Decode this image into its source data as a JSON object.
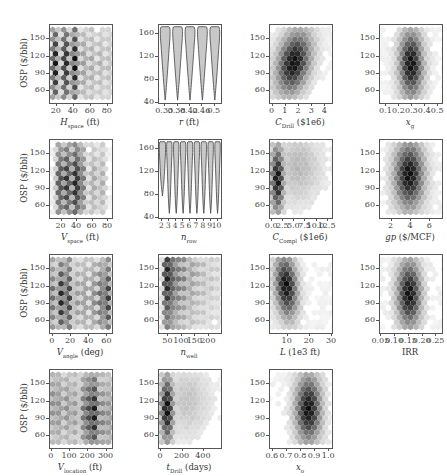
{
  "figure": {
    "ylabel": "OSP ($/bbl)",
    "layout": {
      "rows": 4,
      "cols": 4
    }
  },
  "chart_data": [
    {
      "id": "hspace",
      "type": "heatmap",
      "subtype": "hexbin",
      "row": 0,
      "col": 0,
      "xlabel": "H",
      "xlabel_sub": "space",
      "xlabel_unit": " (ft)",
      "xticks": [
        "20",
        "40",
        "60",
        "80"
      ],
      "xlim": [
        12,
        85
      ],
      "yticks": [
        "60",
        "90",
        "120",
        "150"
      ],
      "ylim": [
        40,
        175
      ],
      "ylabel": "OSP ($/bbl)",
      "density": "discrete vertical bands at ~20,30,40,50,60,70,80; darkest at 20-40, centered ~110"
    },
    {
      "id": "r",
      "type": "violin",
      "row": 0,
      "col": 1,
      "xlabel": "r",
      "xlabel_sub": "",
      "xlabel_unit": " (ft)",
      "categories": [
        "0.33",
        "0.38",
        "0.42",
        "0.46",
        "0.5"
      ],
      "yticks": [
        "40",
        "80",
        "120",
        "160"
      ],
      "ylim": [
        40,
        175
      ],
      "violin_range": [
        45,
        172
      ]
    },
    {
      "id": "cdrill",
      "type": "heatmap",
      "subtype": "hexbin",
      "row": 0,
      "col": 2,
      "xlabel": "C",
      "xlabel_sub": "Drill",
      "xlabel_unit": " ($1e6)",
      "xticks": [
        "0",
        "1",
        "2",
        "3",
        "4"
      ],
      "xlim": [
        -0.2,
        4.5
      ],
      "yticks": [
        "60",
        "90",
        "120",
        "150"
      ],
      "ylim": [
        40,
        175
      ],
      "density": "peak around x≈1.6, y≈110; positive correlation"
    },
    {
      "id": "xg",
      "type": "heatmap",
      "subtype": "hexbin",
      "row": 0,
      "col": 3,
      "xlabel": "x",
      "xlabel_sub": "g",
      "xlabel_unit": "",
      "xticks": [
        "0.1",
        "0.2",
        "0.3",
        "0.4",
        "0.5"
      ],
      "xlim": [
        0.05,
        0.53
      ],
      "yticks": [
        "60",
        "90",
        "120",
        "150"
      ],
      "ylim": [
        40,
        175
      ],
      "density": "peak around x≈0.28, y≈115"
    },
    {
      "id": "vspace",
      "type": "heatmap",
      "subtype": "hexbin",
      "row": 1,
      "col": 0,
      "xlabel": "V",
      "xlabel_sub": "space",
      "xlabel_unit": " (ft)",
      "xticks": [
        "20",
        "40",
        "60",
        "80"
      ],
      "xlim": [
        5,
        85
      ],
      "yticks": [
        "60",
        "90",
        "120",
        "150"
      ],
      "ylim": [
        40,
        175
      ],
      "ylabel": "OSP ($/bbl)",
      "density": "bands at ~15,25,35,45,60,70; darkest at 35-40"
    },
    {
      "id": "nrow",
      "type": "violin",
      "row": 1,
      "col": 1,
      "xlabel": "n",
      "xlabel_sub": "row",
      "xlabel_unit": "",
      "categories": [
        "2",
        "3",
        "4",
        "5",
        "6",
        "7",
        "8",
        "9",
        "10"
      ],
      "yticks": [
        "40",
        "80",
        "120",
        "160"
      ],
      "ylim": [
        40,
        175
      ],
      "violin_range": [
        45,
        172
      ],
      "note": "n=2 violin widest at top, min ~78"
    },
    {
      "id": "ccompl",
      "type": "heatmap",
      "subtype": "hexbin",
      "row": 1,
      "col": 2,
      "xlabel": "C",
      "xlabel_sub": "Compl",
      "xlabel_unit": " ($1e6)",
      "xticks": [
        "0.0",
        "2.5",
        "5.0",
        "7.5",
        "10.0",
        "12.5"
      ],
      "xlim": [
        -0.5,
        13.5
      ],
      "yticks": [
        "60",
        "90",
        "120",
        "150"
      ],
      "ylim": [
        40,
        175
      ],
      "density": "peak at x≈1.5, y≈110; long tail to right"
    },
    {
      "id": "gp",
      "type": "heatmap",
      "subtype": "hexbin",
      "row": 1,
      "col": 3,
      "xlabel": "gp",
      "xlabel_sub": "",
      "xlabel_unit": " ($/MCF)",
      "xticks": [
        "2",
        "4",
        "6"
      ],
      "xlim": [
        0.8,
        7.2
      ],
      "yticks": [
        "60",
        "90",
        "120",
        "150"
      ],
      "ylim": [
        40,
        175
      ],
      "density": "peak at x≈3.7, y≈120"
    },
    {
      "id": "vangle",
      "type": "heatmap",
      "subtype": "hexbin",
      "row": 2,
      "col": 0,
      "xlabel": "V",
      "xlabel_sub": "angle",
      "xlabel_unit": " (deg)",
      "xticks": [
        "0",
        "20",
        "40",
        "60"
      ],
      "xlim": [
        -3,
        65
      ],
      "yticks": [
        "60",
        "90",
        "120",
        "150"
      ],
      "ylim": [
        40,
        175
      ],
      "ylabel": "OSP ($/bbl)",
      "density": "bands; dark at 10-20 and 55-60"
    },
    {
      "id": "nwell",
      "type": "heatmap",
      "subtype": "hexbin",
      "row": 2,
      "col": 1,
      "xlabel": "n",
      "xlabel_sub": "well",
      "xlabel_unit": "",
      "xticks": [
        "50",
        "100",
        "150",
        "200"
      ],
      "xlim": [
        15,
        245
      ],
      "yticks": [
        "60",
        "90",
        "120",
        "150"
      ],
      "ylim": [
        40,
        175
      ],
      "density": "darkest at x≈40, y 120-165; bands to right"
    },
    {
      "id": "L",
      "type": "heatmap",
      "subtype": "hexbin",
      "row": 2,
      "col": 2,
      "xlabel": "L",
      "xlabel_sub": "",
      "xlabel_unit": " (1e3 ft)",
      "xticks": [
        "10",
        "20",
        "30"
      ],
      "xlim": [
        2,
        30
      ],
      "yticks": [
        "60",
        "90",
        "120",
        "150"
      ],
      "ylim": [
        40,
        175
      ],
      "density": "peak at x≈9, y≈130; negative correlation"
    },
    {
      "id": "irr",
      "type": "heatmap",
      "subtype": "hexbin",
      "row": 2,
      "col": 3,
      "xlabel": "IRR",
      "xlabel_sub": "",
      "xlabel_unit": "",
      "xticks": [
        "0.05",
        "0.10",
        "0.15",
        "0.20",
        "0.25"
      ],
      "xlim": [
        0.045,
        0.27
      ],
      "yticks": [
        "60",
        "90",
        "120",
        "150"
      ],
      "ylim": [
        40,
        175
      ],
      "density": "peak at x≈0.15, y≈115"
    },
    {
      "id": "vlocation",
      "type": "heatmap",
      "subtype": "hexbin",
      "row": 3,
      "col": 0,
      "xlabel": "V",
      "xlabel_sub": "location",
      "xlabel_unit": " (ft)",
      "xticks": [
        "0",
        "100",
        "200",
        "300"
      ],
      "xlim": [
        -10,
        330
      ],
      "yticks": [
        "60",
        "90",
        "120",
        "150"
      ],
      "ylim": [
        40,
        175
      ],
      "ylabel": "OSP ($/bbl)",
      "density": "darkest at x≈200-240, y≈95"
    },
    {
      "id": "tdrill",
      "type": "heatmap",
      "subtype": "hexbin",
      "row": 3,
      "col": 1,
      "xlabel": "t",
      "xlabel_sub": "Drill",
      "xlabel_unit": " (days)",
      "xticks": [
        "0",
        "200",
        "400"
      ],
      "xlim": [
        -20,
        560
      ],
      "yticks": [
        "60",
        "90",
        "120",
        "150"
      ],
      "ylim": [
        40,
        175
      ],
      "density": "peak at x≈50, y≈110; tail to right"
    },
    {
      "id": "xo",
      "type": "heatmap",
      "subtype": "hexbin",
      "row": 3,
      "col": 2,
      "xlabel": "x",
      "xlabel_sub": "o",
      "xlabel_unit": "",
      "xticks": [
        "0.6",
        "0.7",
        "0.8",
        "0.9",
        "1.0"
      ],
      "xlim": [
        0.58,
        1.02
      ],
      "yticks": [
        "60",
        "90",
        "120",
        "150"
      ],
      "ylim": [
        40,
        175
      ],
      "density": "peak at x≈0.85, y≈115"
    }
  ]
}
